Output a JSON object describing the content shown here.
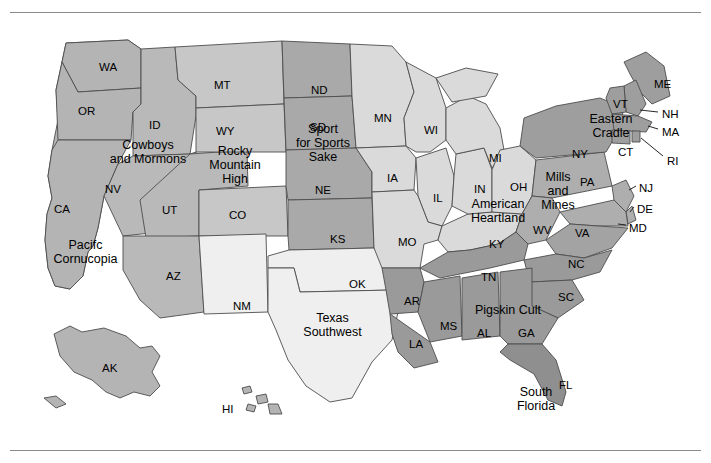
{
  "map": {
    "title_rule": "",
    "regions": [
      {
        "name": "Cowboys and Mormons",
        "label": "Cowboys\nand Mormons",
        "x": 88,
        "y": 138,
        "w": 120,
        "shade": "#b5b5b5"
      },
      {
        "name": "Rocky Mountain High",
        "label": "Rocky\nMountain\nHigh",
        "x": 196,
        "y": 144,
        "w": 78,
        "shade": "#c9c9c9"
      },
      {
        "name": "Sport for Sports Sake",
        "label": "Sport\nfor Sports\nSake",
        "x": 282,
        "y": 122,
        "w": 82,
        "shade": "#aaaaaa"
      },
      {
        "name": "Pacific Cornucopia",
        "label": "Pacifc\nCornucopia",
        "x": 33,
        "y": 238,
        "w": 105,
        "shade": "#b5b5b5"
      },
      {
        "name": "Texas Southwest",
        "label": "Texas\nSouthwest",
        "x": 285,
        "y": 311,
        "w": 95,
        "shade": "#efefef"
      },
      {
        "name": "American Heartland",
        "label": "American\nHeartland",
        "x": 452,
        "y": 197,
        "w": 92,
        "shade": "#d9d9d9"
      },
      {
        "name": "Mills and Mines",
        "label": "Mills\nand\nMines",
        "x": 530,
        "y": 170,
        "w": 56,
        "shade": "#b0b0b0"
      },
      {
        "name": "Eastern Cradle",
        "label": "Eastern\nCradle",
        "x": 578,
        "y": 112,
        "w": 66,
        "shade": "#9e9e9e"
      },
      {
        "name": "Pigskin Cult",
        "label": "Pigskin Cult",
        "x": 463,
        "y": 303,
        "w": 90,
        "shade": "#9a9a9a"
      },
      {
        "name": "South Florida",
        "label": "South\nFlorida",
        "x": 506,
        "y": 385,
        "w": 60,
        "shade": "#8f8f8f"
      }
    ],
    "states": [
      {
        "code": "WA",
        "x": 99,
        "y": 61
      },
      {
        "code": "OR",
        "x": 78,
        "y": 105
      },
      {
        "code": "ID",
        "x": 149,
        "y": 119
      },
      {
        "code": "MT",
        "x": 214,
        "y": 79
      },
      {
        "code": "ND",
        "x": 311,
        "y": 84
      },
      {
        "code": "SD",
        "x": 310,
        "y": 121
      },
      {
        "code": "MN",
        "x": 374,
        "y": 112
      },
      {
        "code": "WI",
        "x": 424,
        "y": 124
      },
      {
        "code": "WY",
        "x": 216,
        "y": 125
      },
      {
        "code": "NV",
        "x": 105,
        "y": 183
      },
      {
        "code": "UT",
        "x": 162,
        "y": 204
      },
      {
        "code": "CO",
        "x": 229,
        "y": 209
      },
      {
        "code": "NE",
        "x": 315,
        "y": 184
      },
      {
        "code": "IA",
        "x": 387,
        "y": 172
      },
      {
        "code": "IL",
        "x": 433,
        "y": 192
      },
      {
        "code": "IN",
        "x": 474,
        "y": 183
      },
      {
        "code": "OH",
        "x": 510,
        "y": 181
      },
      {
        "code": "MI",
        "x": 489,
        "y": 152
      },
      {
        "code": "PA",
        "x": 580,
        "y": 176
      },
      {
        "code": "NY",
        "x": 572,
        "y": 148
      },
      {
        "code": "VT",
        "x": 613,
        "y": 98
      },
      {
        "code": "NH",
        "x": 662,
        "y": 108
      },
      {
        "code": "ME",
        "x": 654,
        "y": 78
      },
      {
        "code": "MA",
        "x": 662,
        "y": 126
      },
      {
        "code": "CT",
        "x": 618,
        "y": 146
      },
      {
        "code": "RI",
        "x": 667,
        "y": 155
      },
      {
        "code": "NJ",
        "x": 639,
        "y": 182
      },
      {
        "code": "DE",
        "x": 637,
        "y": 203
      },
      {
        "code": "MD",
        "x": 629,
        "y": 222
      },
      {
        "code": "WV",
        "x": 533,
        "y": 224
      },
      {
        "code": "VA",
        "x": 575,
        "y": 227
      },
      {
        "code": "KY",
        "x": 489,
        "y": 238
      },
      {
        "code": "CA",
        "x": 54,
        "y": 203
      },
      {
        "code": "AZ",
        "x": 166,
        "y": 270
      },
      {
        "code": "NM",
        "x": 233,
        "y": 300
      },
      {
        "code": "KS",
        "x": 330,
        "y": 233
      },
      {
        "code": "MO",
        "x": 398,
        "y": 236
      },
      {
        "code": "OK",
        "x": 349,
        "y": 278
      },
      {
        "code": "AR",
        "x": 404,
        "y": 295
      },
      {
        "code": "TN",
        "x": 481,
        "y": 271
      },
      {
        "code": "NC",
        "x": 568,
        "y": 258
      },
      {
        "code": "SC",
        "x": 558,
        "y": 291
      },
      {
        "code": "MS",
        "x": 440,
        "y": 320
      },
      {
        "code": "AL",
        "x": 477,
        "y": 327
      },
      {
        "code": "GA",
        "x": 518,
        "y": 327
      },
      {
        "code": "LA",
        "x": 409,
        "y": 338
      },
      {
        "code": "FL",
        "x": 559,
        "y": 379
      },
      {
        "code": "AK",
        "x": 102,
        "y": 362
      },
      {
        "code": "HI",
        "x": 222,
        "y": 403
      }
    ]
  }
}
